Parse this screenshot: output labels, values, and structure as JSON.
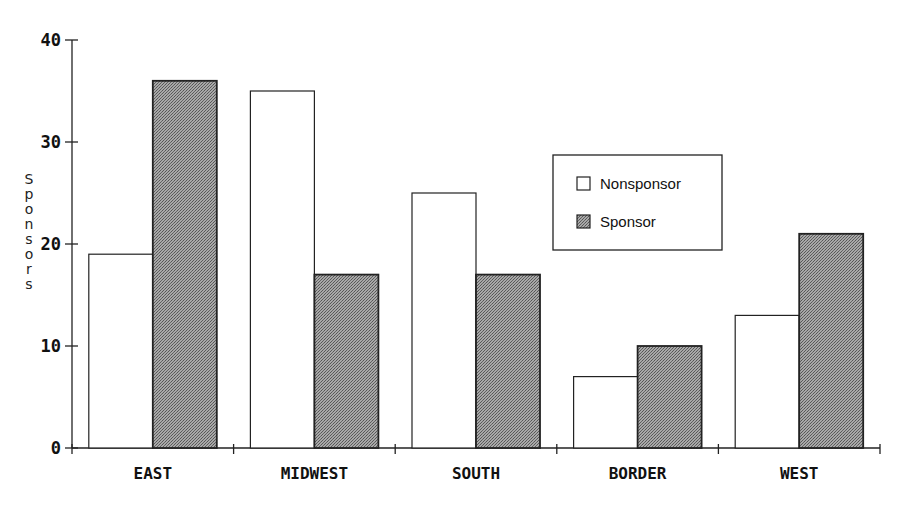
{
  "chart_data": {
    "type": "bar",
    "title": "",
    "xlabel": "",
    "ylabel": "Sponsors",
    "ylim": [
      0,
      40
    ],
    "yticks": [
      0,
      10,
      20,
      30,
      40
    ],
    "grid": false,
    "legend_position": "upper right (inside plot)",
    "categories": [
      "EAST",
      "MIDWEST",
      "SOUTH",
      "BORDER",
      "WEST"
    ],
    "series": [
      {
        "name": "Nonsponsor",
        "values": [
          19,
          35,
          25,
          7,
          13
        ],
        "color": "#ffffff"
      },
      {
        "name": "Sponsor",
        "values": [
          36,
          17,
          17,
          10,
          21
        ],
        "color": "#8c8c8c"
      }
    ]
  },
  "legend": {
    "items": [
      "Nonsponsor",
      "Sponsor"
    ]
  }
}
